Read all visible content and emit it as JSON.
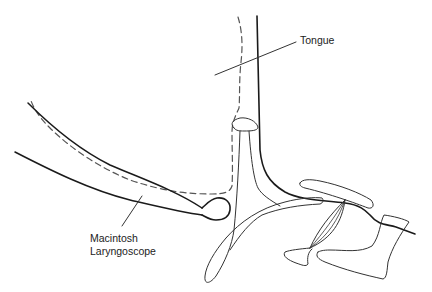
{
  "diagram": {
    "labels": {
      "tongue": "Tongue",
      "laryngoscope_line1": "Macintosh",
      "laryngoscope_line2": "Laryngoscope"
    },
    "colors": {
      "line": "#1a1a1a",
      "thin_line": "#333333",
      "dashed": "#555555",
      "background": "#ffffff"
    }
  }
}
